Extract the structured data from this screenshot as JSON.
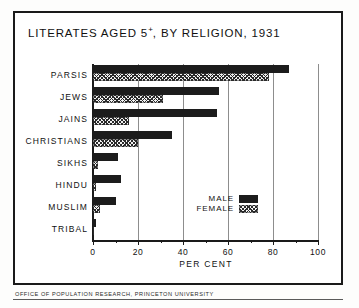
{
  "chart_data": {
    "type": "bar",
    "orientation": "horizontal",
    "title": "LITERATES AGED 5+, BY RELIGION, 1931",
    "title_main": "LITERATES AGED 5",
    "title_sup": "+",
    "title_rest": ", BY RELIGION, 1931",
    "xlabel": "PER CENT",
    "ylabel": "",
    "xlim": [
      0,
      100
    ],
    "xticks": [
      0,
      20,
      40,
      60,
      80,
      100
    ],
    "xtick_labels": [
      "0",
      "20",
      "40",
      "60",
      "80",
      "100"
    ],
    "xminorticks": [
      10,
      30,
      50,
      70,
      90
    ],
    "grid": true,
    "legend_position": "inside-right",
    "categories": [
      "PARSIS",
      "JEWS",
      "JAINS",
      "CHRISTIANS",
      "SIKHS",
      "HINDU",
      "MUSLIM",
      "TRIBAL"
    ],
    "series": [
      {
        "name": "MALE",
        "color": "#1c1c1c",
        "fill": "solid",
        "values": [
          87,
          56,
          55,
          35,
          11,
          12.5,
          10,
          1.5
        ]
      },
      {
        "name": "FEMALE",
        "color": "#2a2a2a",
        "fill": "hatched",
        "values": [
          78,
          31,
          16,
          20,
          2,
          1.5,
          3,
          0.4
        ]
      }
    ]
  },
  "legend": {
    "entries": [
      {
        "label": "MALE",
        "swatch": "solid-black-swatch"
      },
      {
        "label": "FEMALE",
        "swatch": "hatched-swatch"
      }
    ]
  },
  "credit": "OFFICE OF POPULATION RESEARCH, PRINCETON UNIVERSITY"
}
